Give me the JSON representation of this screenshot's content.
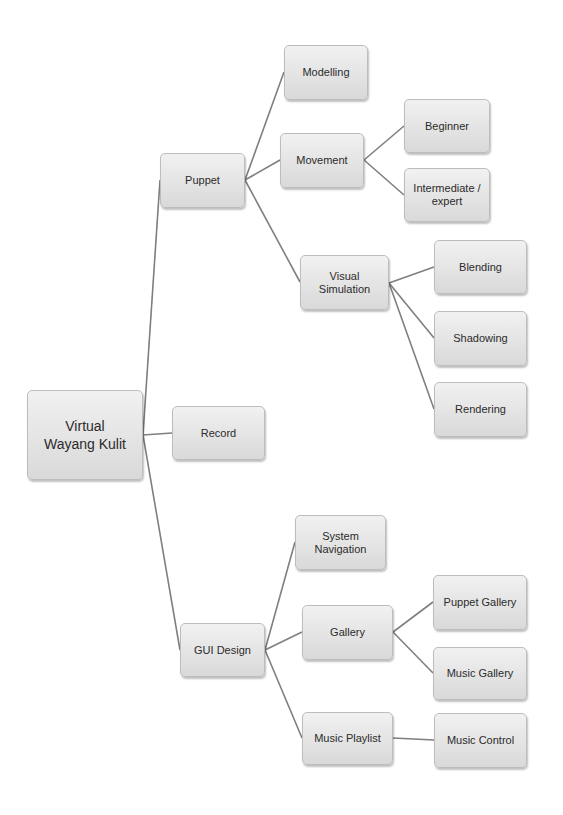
{
  "diagram": {
    "type": "tree",
    "colors": {
      "node_fill_top": "#f1f1f1",
      "node_fill_bottom": "#d9d9d9",
      "node_border": "#bdbdbd",
      "edge": "#7f7f7f",
      "text": "#2b2b2b"
    },
    "root": {
      "id": "root",
      "label": "Virtual Wayang Kulit",
      "label_lines": [
        "Virtual",
        "Wayang Kulit"
      ]
    },
    "nodes": {
      "puppet": {
        "label": "Puppet",
        "parent": "root"
      },
      "record": {
        "label": "Record",
        "parent": "root"
      },
      "gui_design": {
        "label": "GUI Design",
        "parent": "root"
      },
      "modelling": {
        "label": "Modelling",
        "parent": "puppet"
      },
      "movement": {
        "label": "Movement",
        "parent": "puppet"
      },
      "visual_simulation": {
        "label": "Visual Simulation",
        "parent": "puppet"
      },
      "beginner": {
        "label": "Beginner",
        "parent": "movement"
      },
      "intermediate_expert": {
        "label": "Intermediate / expert",
        "parent": "movement"
      },
      "blending": {
        "label": "Blending",
        "parent": "visual_simulation"
      },
      "shadowing": {
        "label": "Shadowing",
        "parent": "visual_simulation"
      },
      "rendering": {
        "label": "Rendering",
        "parent": "visual_simulation"
      },
      "system_navigation": {
        "label": "System Navigation",
        "parent": "gui_design"
      },
      "gallery": {
        "label": "Gallery",
        "parent": "gui_design"
      },
      "music_playlist": {
        "label": "Music Playlist",
        "parent": "gui_design"
      },
      "puppet_gallery": {
        "label": "Puppet Gallery",
        "parent": "gallery"
      },
      "music_gallery": {
        "label": "Music Gallery",
        "parent": "gallery"
      },
      "music_control": {
        "label": "Music Control",
        "parent": "music_playlist"
      }
    },
    "edges": [
      [
        "root",
        "puppet"
      ],
      [
        "root",
        "record"
      ],
      [
        "root",
        "gui_design"
      ],
      [
        "puppet",
        "modelling"
      ],
      [
        "puppet",
        "movement"
      ],
      [
        "puppet",
        "visual_simulation"
      ],
      [
        "movement",
        "beginner"
      ],
      [
        "movement",
        "intermediate_expert"
      ],
      [
        "visual_simulation",
        "blending"
      ],
      [
        "visual_simulation",
        "shadowing"
      ],
      [
        "visual_simulation",
        "rendering"
      ],
      [
        "gui_design",
        "system_navigation"
      ],
      [
        "gui_design",
        "gallery"
      ],
      [
        "gui_design",
        "music_playlist"
      ],
      [
        "gallery",
        "puppet_gallery"
      ],
      [
        "gallery",
        "music_gallery"
      ],
      [
        "music_playlist",
        "music_control"
      ]
    ]
  }
}
